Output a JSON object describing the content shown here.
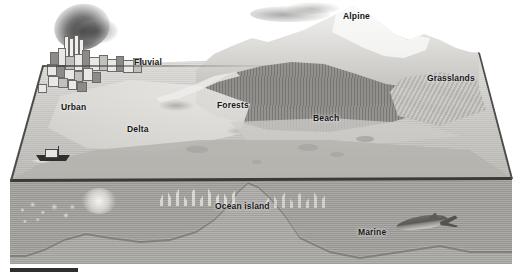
{
  "figure": {
    "type": "3d-block-diagram",
    "palette": {
      "background": "#ffffff",
      "land_light": "#e6e5e3",
      "land_mid": "#c3c1bd",
      "water_surface": "#bdbbb7",
      "water_cut": "#a3a19d",
      "seabed": "#b5b3af",
      "outline": "#3a3a39",
      "label_text": "#161616"
    },
    "scalebar": {
      "name": "scale-bar",
      "color": "#2e2e2d"
    }
  },
  "labels": [
    {
      "id": "alpine",
      "text": "Alpine",
      "x": 343,
      "y": 12,
      "zone": "above-water"
    },
    {
      "id": "fluvial",
      "text": "Fluvial",
      "x": 134,
      "y": 58,
      "zone": "above-water"
    },
    {
      "id": "grasslands",
      "text": "Grasslands",
      "x": 427,
      "y": 74,
      "zone": "above-water"
    },
    {
      "id": "forests",
      "text": "Forests",
      "x": 217,
      "y": 101,
      "zone": "above-water"
    },
    {
      "id": "urban",
      "text": "Urban",
      "x": 61,
      "y": 103,
      "zone": "above-water"
    },
    {
      "id": "beach",
      "text": "Beach",
      "x": 313,
      "y": 114,
      "zone": "above-water"
    },
    {
      "id": "delta",
      "text": "Delta",
      "x": 127,
      "y": 125,
      "zone": "above-water"
    },
    {
      "id": "ocean-island",
      "text": "Ocean island",
      "x": 215,
      "y": 202,
      "zone": "below-water"
    },
    {
      "id": "marine",
      "text": "Marine",
      "x": 358,
      "y": 228,
      "zone": "below-water"
    }
  ],
  "scene_elements": [
    {
      "id": "smoke-plume",
      "name": "smoke-plume-icon"
    },
    {
      "id": "cloud",
      "name": "cloud-icon"
    },
    {
      "id": "city-cluster",
      "name": "city-buildings"
    },
    {
      "id": "boat",
      "name": "boat-icon"
    },
    {
      "id": "mountain-peak",
      "name": "mountain-peak"
    },
    {
      "id": "snow-cap",
      "name": "snow-cap"
    },
    {
      "id": "forest-band",
      "name": "forest-band"
    },
    {
      "id": "grass-field",
      "name": "grass-field"
    },
    {
      "id": "coral-reef",
      "name": "coral-reef"
    },
    {
      "id": "hydrothermal-vent",
      "name": "hydrothermal-vent"
    },
    {
      "id": "seamount",
      "name": "seamount"
    },
    {
      "id": "whale",
      "name": "whale-icon"
    }
  ]
}
